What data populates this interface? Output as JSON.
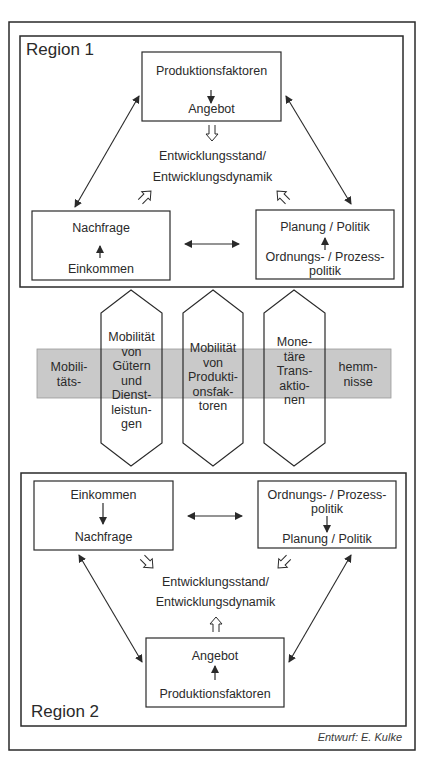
{
  "colors": {
    "line": "#2a2a2a",
    "band": "#c9c9c9",
    "background": "#ffffff"
  },
  "region1": {
    "label": "Region 1",
    "top_box": {
      "line1": "Produktionsfaktoren",
      "line2": "Angebot",
      "arrow": "down"
    },
    "center": {
      "line1": "Entwicklungsstand/",
      "line2": "Entwicklungsdynamik"
    },
    "left_box": {
      "line1": "Nachfrage",
      "line2": "Einkommen",
      "arrow": "up"
    },
    "right_box": {
      "line1": "Planung / Politik",
      "line2": "Ordnungs- / Prozess-",
      "line3": "politik",
      "arrow": "up"
    }
  },
  "barrier": {
    "left_label": {
      "line1": "Mobili-",
      "line2": "täts-"
    },
    "right_label": {
      "line1": "hemm-",
      "line2": "nisse"
    },
    "columns": [
      {
        "lines": [
          "Mobilität",
          "von",
          "Gütern",
          "und",
          "Dienst-",
          "leistun-",
          "gen"
        ]
      },
      {
        "lines": [
          "Mobilität",
          "von",
          "Produkti-",
          "onsfak-",
          "toren"
        ]
      },
      {
        "lines": [
          "Mone-",
          "täre",
          "Trans-",
          "aktio-",
          "nen"
        ]
      }
    ]
  },
  "region2": {
    "label": "Region 2",
    "left_box": {
      "line1": "Einkommen",
      "line2": "Nachfrage",
      "arrow": "down"
    },
    "right_box": {
      "line1": "Ordnungs- / Prozess-",
      "line2": "politik",
      "line3": "Planung / Politik",
      "arrow": "down"
    },
    "center": {
      "line1": "Entwicklungsstand/",
      "line2": "Entwicklungsdynamik"
    },
    "bottom_box": {
      "line1": "Angebot",
      "line2": "Produktionsfaktoren",
      "arrow": "up"
    }
  },
  "credit": "Entwurf: E. Kulke"
}
